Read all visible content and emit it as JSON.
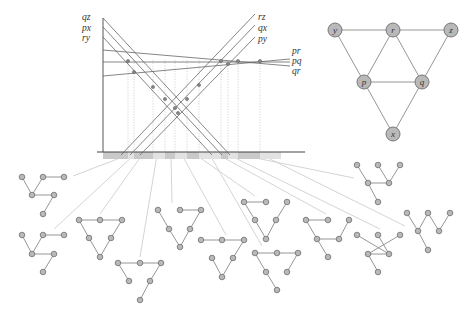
{
  "colors": {
    "line": "#666666",
    "axis": "#444444",
    "guide": "#bbbbbb",
    "arrow": "#cfcfcf",
    "node_fill": "#b9b9b9",
    "node_stroke": "#6e6e6e",
    "edge": "#8a8a8a",
    "strip_light": "#e2e2e2",
    "strip_dark": "#c9c9c9"
  },
  "arrangement": {
    "axis": {
      "x": 103,
      "y_top": 18,
      "y_bottom": 152,
      "x_right": 305
    },
    "lines": [
      {
        "label": "qz",
        "x1": 103,
        "y1": 18,
        "x2": 230,
        "y2": 155,
        "label_x": 82,
        "label_y": 20
      },
      {
        "label": "px",
        "x1": 103,
        "y1": 27,
        "x2": 222,
        "y2": 155,
        "label_x": 82,
        "label_y": 31
      },
      {
        "label": "ry",
        "x1": 103,
        "y1": 37,
        "x2": 212,
        "y2": 155,
        "label_x": 82,
        "label_y": 41
      },
      {
        "label": "rz",
        "x1": 121,
        "y1": 155,
        "x2": 255,
        "y2": 14,
        "label_x": 258,
        "label_y": 20
      },
      {
        "label": "qx",
        "x1": 130,
        "y1": 155,
        "x2": 255,
        "y2": 25,
        "label_x": 258,
        "label_y": 31
      },
      {
        "label": "py",
        "x1": 140,
        "y1": 155,
        "x2": 255,
        "y2": 37,
        "label_x": 258,
        "label_y": 42
      },
      {
        "label": "pr",
        "x1": 103,
        "y1": 50,
        "x2": 290,
        "y2": 66,
        "label_x": 292,
        "label_y": 54
      },
      {
        "label": "pq",
        "x1": 103,
        "y1": 62,
        "x2": 290,
        "y2": 62,
        "label_x": 292,
        "label_y": 64
      },
      {
        "label": "qr",
        "x1": 103,
        "y1": 76,
        "x2": 290,
        "y2": 59,
        "label_x": 292,
        "label_y": 74
      }
    ],
    "vertices": [
      [
        128,
        61
      ],
      [
        134,
        72
      ],
      [
        153,
        87
      ],
      [
        165,
        99
      ],
      [
        175,
        108
      ],
      [
        178,
        113
      ],
      [
        187,
        99
      ],
      [
        199,
        85
      ],
      [
        221,
        61
      ],
      [
        228,
        64
      ],
      [
        238,
        61
      ],
      [
        260,
        61
      ]
    ],
    "guides_x": [
      128,
      134,
      153,
      165,
      175,
      187,
      199,
      221,
      228,
      238,
      260
    ],
    "strip": {
      "x": 103,
      "y": 152,
      "width": 178,
      "height": 7
    },
    "strip_segments": [
      {
        "x": 103,
        "w": 25,
        "shade": "dark"
      },
      {
        "x": 128,
        "w": 6,
        "shade": "light"
      },
      {
        "x": 134,
        "w": 19,
        "shade": "dark"
      },
      {
        "x": 153,
        "w": 12,
        "shade": "light"
      },
      {
        "x": 165,
        "w": 10,
        "shade": "dark"
      },
      {
        "x": 175,
        "w": 12,
        "shade": "light"
      },
      {
        "x": 187,
        "w": 12,
        "shade": "dark"
      },
      {
        "x": 199,
        "w": 22,
        "shade": "light"
      },
      {
        "x": 221,
        "w": 7,
        "shade": "dark"
      },
      {
        "x": 228,
        "w": 10,
        "shade": "light"
      },
      {
        "x": 238,
        "w": 22,
        "shade": "dark"
      },
      {
        "x": 260,
        "w": 21,
        "shade": "light"
      }
    ]
  },
  "graph": {
    "nodes": [
      {
        "id": "y",
        "label": "y",
        "x": 335,
        "y": 30
      },
      {
        "id": "r",
        "label": "r",
        "x": 393,
        "y": 30
      },
      {
        "id": "z",
        "label": "z",
        "x": 451,
        "y": 30
      },
      {
        "id": "p",
        "label": "p",
        "x": 364,
        "y": 82
      },
      {
        "id": "q",
        "label": "q",
        "x": 422,
        "y": 82
      },
      {
        "id": "x",
        "label": "x",
        "x": 393,
        "y": 134
      }
    ],
    "edges": [
      [
        "y",
        "r"
      ],
      [
        "r",
        "z"
      ],
      [
        "y",
        "p"
      ],
      [
        "r",
        "p"
      ],
      [
        "r",
        "q"
      ],
      [
        "z",
        "q"
      ],
      [
        "p",
        "q"
      ],
      [
        "p",
        "x"
      ],
      [
        "q",
        "x"
      ]
    ],
    "node_radius": 7
  },
  "trees": [
    {
      "name": "tree-1",
      "nodes": [
        [
          22,
          177
        ],
        [
          43,
          177
        ],
        [
          64,
          177
        ],
        [
          32,
          195
        ],
        [
          54,
          195
        ],
        [
          43,
          214
        ]
      ],
      "edges": [
        [
          0,
          3
        ],
        [
          1,
          2
        ],
        [
          1,
          3
        ],
        [
          3,
          4
        ],
        [
          4,
          5
        ]
      ],
      "arrow": [
        73,
        176,
        128,
        155
      ]
    },
    {
      "name": "tree-2",
      "nodes": [
        [
          22,
          235
        ],
        [
          43,
          235
        ],
        [
          64,
          235
        ],
        [
          32,
          254
        ],
        [
          54,
          254
        ],
        [
          43,
          272
        ]
      ],
      "edges": [
        [
          0,
          3
        ],
        [
          1,
          2
        ],
        [
          1,
          3
        ],
        [
          3,
          4
        ],
        [
          4,
          5
        ]
      ],
      "arrow": [
        54,
        229,
        134,
        155
      ]
    },
    {
      "name": "tree-3",
      "nodes": [
        [
          79,
          220
        ],
        [
          100,
          220
        ],
        [
          122,
          220
        ],
        [
          89,
          238
        ],
        [
          111,
          238
        ],
        [
          100,
          257
        ]
      ],
      "edges": [
        [
          0,
          1
        ],
        [
          1,
          2
        ],
        [
          0,
          3
        ],
        [
          3,
          5
        ],
        [
          4,
          5
        ],
        [
          2,
          4
        ]
      ],
      "arrow": [
        100,
        214,
        142,
        155
      ]
    },
    {
      "name": "tree-4",
      "nodes": [
        [
          118,
          263
        ],
        [
          140,
          263
        ],
        [
          161,
          263
        ],
        [
          129,
          281
        ],
        [
          150,
          281
        ],
        [
          140,
          300
        ]
      ],
      "edges": [
        [
          0,
          1
        ],
        [
          1,
          2
        ],
        [
          0,
          3
        ],
        [
          2,
          4
        ],
        [
          4,
          5
        ]
      ],
      "arrow": [
        140,
        257,
        157,
        155
      ]
    },
    {
      "name": "tree-5",
      "nodes": [
        [
          158,
          210
        ],
        [
          180,
          210
        ],
        [
          201,
          210
        ],
        [
          169,
          229
        ],
        [
          190,
          229
        ],
        [
          180,
          247
        ]
      ],
      "edges": [
        [
          1,
          2
        ],
        [
          0,
          3
        ],
        [
          3,
          5
        ],
        [
          4,
          5
        ],
        [
          2,
          4
        ]
      ],
      "arrow": [
        172,
        203,
        171,
        155
      ]
    },
    {
      "name": "tree-6",
      "nodes": [
        [
          201,
          240
        ],
        [
          222,
          240
        ],
        [
          244,
          240
        ],
        [
          212,
          258
        ],
        [
          233,
          258
        ],
        [
          222,
          277
        ]
      ],
      "edges": [
        [
          0,
          1
        ],
        [
          1,
          2
        ],
        [
          2,
          4
        ],
        [
          4,
          5
        ],
        [
          3,
          5
        ]
      ],
      "arrow": [
        226,
        235,
        182,
        155
      ]
    },
    {
      "name": "tree-7",
      "nodes": [
        [
          244,
          202
        ],
        [
          266,
          202
        ],
        [
          287,
          202
        ],
        [
          255,
          220
        ],
        [
          276,
          220
        ],
        [
          266,
          239
        ]
      ],
      "edges": [
        [
          0,
          1
        ],
        [
          0,
          3
        ],
        [
          3,
          5
        ],
        [
          4,
          5
        ],
        [
          2,
          4
        ]
      ],
      "arrow": [
        255,
        196,
        196,
        155
      ]
    },
    {
      "name": "tree-8",
      "nodes": [
        [
          255,
          253
        ],
        [
          277,
          253
        ],
        [
          298,
          253
        ],
        [
          266,
          272
        ],
        [
          287,
          272
        ],
        [
          277,
          290
        ]
      ],
      "edges": [
        [
          0,
          1
        ],
        [
          1,
          2
        ],
        [
          0,
          3
        ],
        [
          3,
          5
        ],
        [
          2,
          4
        ]
      ],
      "arrow": [
        262,
        246,
        210,
        155
      ]
    },
    {
      "name": "tree-9",
      "nodes": [
        [
          306,
          220
        ],
        [
          328,
          220
        ],
        [
          349,
          220
        ],
        [
          317,
          239
        ],
        [
          339,
          239
        ],
        [
          328,
          257
        ]
      ],
      "edges": [
        [
          0,
          1
        ],
        [
          0,
          3
        ],
        [
          3,
          4
        ],
        [
          3,
          5
        ],
        [
          2,
          4
        ]
      ],
      "arrow": [
        326,
        214,
        219,
        155
      ]
    },
    {
      "name": "tree-10",
      "nodes": [
        [
          357,
          235
        ],
        [
          378,
          235
        ],
        [
          400,
          235
        ],
        [
          368,
          254
        ],
        [
          389,
          254
        ],
        [
          378,
          272
        ]
      ],
      "edges": [
        [
          0,
          4
        ],
        [
          1,
          4
        ],
        [
          4,
          3
        ],
        [
          3,
          5
        ],
        [
          2,
          3
        ]
      ],
      "arrow": [
        380,
        229,
        229,
        155
      ]
    },
    {
      "name": "tree-11",
      "nodes": [
        [
          357,
          165
        ],
        [
          378,
          165
        ],
        [
          400,
          165
        ],
        [
          368,
          183
        ],
        [
          389,
          183
        ],
        [
          378,
          202
        ]
      ],
      "edges": [
        [
          0,
          3
        ],
        [
          3,
          4
        ],
        [
          1,
          4
        ],
        [
          2,
          4
        ],
        [
          3,
          5
        ]
      ],
      "arrow": [
        354,
        178,
        241,
        155
      ]
    },
    {
      "name": "tree-12",
      "nodes": [
        [
          407,
          213
        ],
        [
          428,
          213
        ],
        [
          450,
          213
        ],
        [
          418,
          231
        ],
        [
          439,
          231
        ],
        [
          428,
          250
        ]
      ],
      "edges": [
        [
          0,
          3
        ],
        [
          1,
          3
        ],
        [
          1,
          4
        ],
        [
          2,
          4
        ],
        [
          3,
          5
        ]
      ],
      "arrow": [
        405,
        226,
        262,
        155
      ]
    }
  ]
}
